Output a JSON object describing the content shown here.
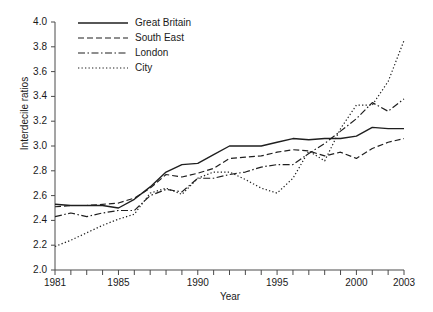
{
  "chart_data": {
    "type": "line",
    "title": "",
    "xlabel": "Year",
    "ylabel": "Interdecile ratios",
    "xlim": [
      1981,
      2003
    ],
    "ylim": [
      2.0,
      4.0
    ],
    "ytick_labels": [
      "4.0",
      "3.8",
      "3.6",
      "3.4",
      "3.2",
      "3.0",
      "2.8",
      "2.6",
      "2.4",
      "2.2",
      "2.0"
    ],
    "ytick_values": [
      4.0,
      3.8,
      3.6,
      3.4,
      3.2,
      3.0,
      2.8,
      2.6,
      2.4,
      2.2,
      2.0
    ],
    "xtick_values": [
      1981,
      1982,
      1983,
      1984,
      1985,
      1986,
      1987,
      1988,
      1989,
      1990,
      1991,
      1992,
      1993,
      1994,
      1995,
      1996,
      1997,
      1998,
      1999,
      2000,
      2001,
      2002,
      2003
    ],
    "xtick_labels": [
      {
        "value": 1981,
        "label": "1981"
      },
      {
        "value": 1985,
        "label": "1985"
      },
      {
        "value": 1990,
        "label": "1990"
      },
      {
        "value": 1995,
        "label": "1995"
      },
      {
        "value": 2000,
        "label": "2000"
      },
      {
        "value": 2003,
        "label": "2003"
      }
    ],
    "grid": false,
    "legend_position": "upper left",
    "x": [
      1981,
      1982,
      1983,
      1984,
      1985,
      1986,
      1987,
      1988,
      1989,
      1990,
      1991,
      1992,
      1993,
      1994,
      1995,
      1996,
      1997,
      1998,
      1999,
      2000,
      2001,
      2002,
      2003
    ],
    "series": [
      {
        "name": "Great Britain",
        "style": "solid",
        "color": "#1f1f1f",
        "values": [
          2.53,
          2.52,
          2.52,
          2.52,
          2.5,
          2.57,
          2.67,
          2.79,
          2.85,
          2.86,
          2.93,
          3.0,
          3.0,
          3.0,
          3.03,
          3.06,
          3.05,
          3.06,
          3.06,
          3.08,
          3.15,
          3.14,
          3.14
        ]
      },
      {
        "name": "South East",
        "style": "dashed",
        "color": "#1f1f1f",
        "values": [
          2.51,
          2.52,
          2.52,
          2.53,
          2.54,
          2.58,
          2.66,
          2.77,
          2.75,
          2.78,
          2.82,
          2.9,
          2.91,
          2.92,
          2.95,
          2.97,
          2.96,
          2.92,
          2.95,
          2.9,
          2.98,
          3.03,
          3.06
        ]
      },
      {
        "name": "London",
        "style": "dashdot",
        "color": "#1f1f1f",
        "values": [
          2.43,
          2.46,
          2.43,
          2.46,
          2.48,
          2.48,
          2.6,
          2.65,
          2.63,
          2.74,
          2.74,
          2.77,
          2.79,
          2.83,
          2.85,
          2.85,
          2.94,
          3.02,
          3.12,
          3.22,
          3.35,
          3.28,
          3.38
        ]
      },
      {
        "name": "City",
        "style": "dotted",
        "color": "#1f1f1f",
        "values": [
          2.19,
          2.24,
          2.3,
          2.36,
          2.41,
          2.45,
          2.62,
          2.66,
          2.61,
          2.74,
          2.79,
          2.79,
          2.73,
          2.66,
          2.62,
          2.74,
          2.96,
          2.88,
          3.14,
          3.33,
          3.33,
          3.52,
          3.85
        ]
      }
    ]
  },
  "legend": {
    "entries": [
      {
        "label": "Great Britain",
        "style": "solid"
      },
      {
        "label": "South East",
        "style": "dashed"
      },
      {
        "label": "London",
        "style": "dashdot"
      },
      {
        "label": "City",
        "style": "dotted"
      }
    ]
  }
}
